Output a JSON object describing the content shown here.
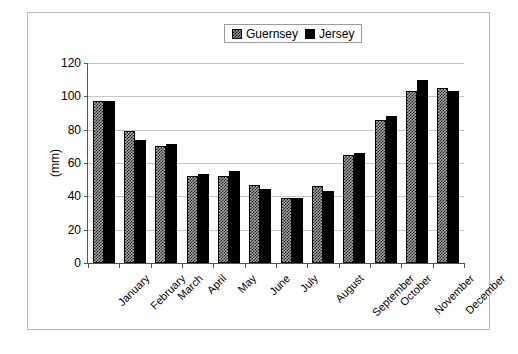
{
  "chart_data": {
    "type": "bar",
    "title": "",
    "xlabel": "",
    "ylabel": "(mm)",
    "ylim": [
      0,
      120
    ],
    "yticks": [
      0,
      20,
      40,
      60,
      80,
      100,
      120
    ],
    "grid": true,
    "legend_position": "top-center",
    "categories": [
      "January",
      "February",
      "March",
      "April",
      "May",
      "June",
      "July",
      "August",
      "September",
      "October",
      "November",
      "December"
    ],
    "series": [
      {
        "name": "Guernsey",
        "color": "#a8a8a8",
        "pattern": "checkered",
        "values": [
          97,
          79,
          70,
          52,
          52,
          47,
          39,
          46.5,
          65,
          86,
          103,
          105
        ]
      },
      {
        "name": "Jersey",
        "color": "#000000",
        "pattern": "solid",
        "values": [
          97,
          74,
          71.5,
          53.5,
          55,
          44.5,
          39,
          43,
          66,
          88,
          110,
          103.5
        ]
      }
    ]
  },
  "legend": {
    "entries": [
      {
        "label": "Guernsey",
        "swatch": "checkered-gray-swatch"
      },
      {
        "label": "Jersey",
        "swatch": "solid-black-swatch"
      }
    ]
  }
}
